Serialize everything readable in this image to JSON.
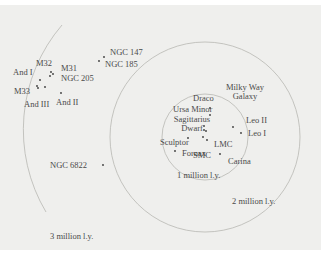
{
  "diagram": {
    "type": "distance-ring-map",
    "center_label": "Milky Way Galaxy",
    "colors": {
      "background": "#efefed",
      "ring": "#b7b7b3",
      "text": "#4a4a4a",
      "dot": "#3a3a3a"
    },
    "rings": [
      {
        "label": "1 million l.y.",
        "cx": 205,
        "cy": 137,
        "r": 43
      },
      {
        "label": "2 million l.y.",
        "cx": 205,
        "cy": 137,
        "r": 95
      },
      {
        "label": "3 million l.y.",
        "cx": 205,
        "cy": 137,
        "r": 161
      }
    ],
    "galaxies": [
      {
        "name": "Milky Way",
        "name2": "Galaxy",
        "x": 206,
        "y": 131
      },
      {
        "name": "Draco",
        "x": 210,
        "y": 108
      },
      {
        "name": "Ursa Minor",
        "x": 209,
        "y": 114
      },
      {
        "name": "Sagittarius",
        "name2": "Dwarf",
        "x": 204,
        "y": 126
      },
      {
        "name": "Sculptor",
        "x": 188,
        "y": 137
      },
      {
        "name": "SMC",
        "x": 202,
        "y": 137
      },
      {
        "name": "LMC",
        "x": 207,
        "y": 139
      },
      {
        "name": "Carina",
        "x": 220,
        "y": 154
      },
      {
        "name": "Leo II",
        "x": 233,
        "y": 126
      },
      {
        "name": "Leo I",
        "x": 241,
        "y": 132
      },
      {
        "name": "Fornax",
        "x": 175,
        "y": 149
      },
      {
        "name": "NGC 6822",
        "x": 103,
        "y": 164
      },
      {
        "name": "NGC 147",
        "x": 104,
        "y": 57
      },
      {
        "name": "NGC 185",
        "x": 99,
        "y": 61
      },
      {
        "name": "M32",
        "x": 51,
        "y": 71
      },
      {
        "name": "M31",
        "x": 54,
        "y": 74
      },
      {
        "name": "NGC 205",
        "x": 50,
        "y": 75
      },
      {
        "name": "And I",
        "x": 40,
        "y": 80
      },
      {
        "name": "M33",
        "x": 37,
        "y": 86
      },
      {
        "name": "And III",
        "x": 45,
        "y": 87
      },
      {
        "name": "And II",
        "x": 62,
        "y": 93
      }
    ]
  },
  "labels": {
    "milky_way_1": "Milky Way",
    "milky_way_2": "Galaxy",
    "draco": "Draco",
    "ursa_minor": "Ursa Minor",
    "sagittarius_1": "Sagittarius",
    "sagittarius_2": "Dwarf",
    "sculptor": "Sculptor",
    "smc": "SMC",
    "lmc": "LMC",
    "carina": "Carina",
    "leo2": "Leo II",
    "leo1": "Leo I",
    "fornax": "Fornax",
    "ngc6822": "NGC 6822",
    "ngc147": "NGC 147",
    "ngc185": "NGC 185",
    "m32": "M32",
    "m31": "M31",
    "ngc205": "NGC 205",
    "and1": "And I",
    "m33": "M33",
    "and3": "And III",
    "and2": "And II",
    "ring1": "1 million l.y.",
    "ring2": "2 million l.y.",
    "ring3": "3 million l.y."
  }
}
